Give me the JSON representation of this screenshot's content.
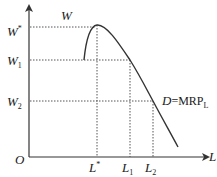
{
  "diagram": {
    "type": "labor-demand-curve",
    "axes": {
      "origin_label": "O",
      "x_label": "L",
      "y_label": ""
    },
    "y_ticks": [
      {
        "label": "W",
        "sup": "*",
        "y": 27
      },
      {
        "label": "W",
        "sub": "1",
        "y": 60
      },
      {
        "label": "W",
        "sub": "2",
        "y": 101
      }
    ],
    "x_ticks": [
      {
        "label": "L",
        "sup": "*",
        "x": 97
      },
      {
        "label": "L",
        "sub": "1",
        "x": 130
      },
      {
        "label": "L",
        "sub": "2",
        "x": 153
      }
    ],
    "curve_labels": {
      "peak_label": "W",
      "demand_label_D": "D",
      "demand_label_rest": "=MRP",
      "demand_label_sub": "L"
    },
    "colors": {
      "line": "#333333",
      "dotted": "#555555",
      "text": "#1a1a1a"
    }
  }
}
